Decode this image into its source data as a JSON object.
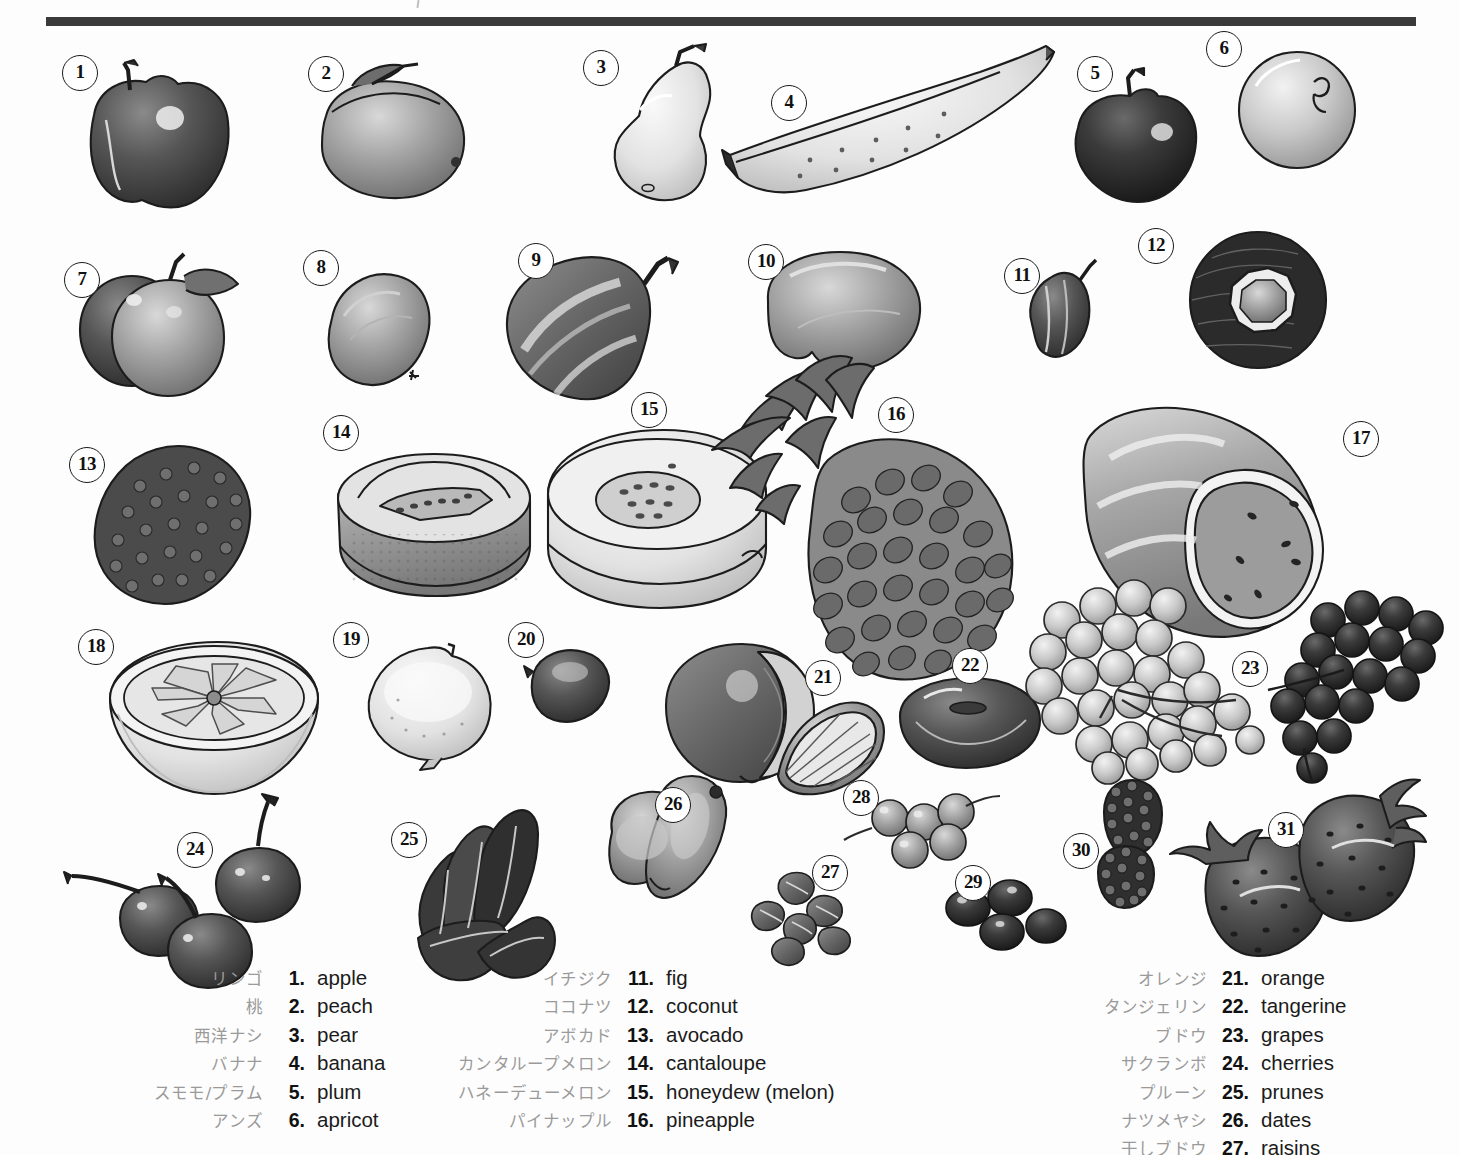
{
  "page": {
    "rule_color": "#3a3a3a",
    "background": "#ffffff",
    "text_color": "#1b1b1b",
    "japanese_text_color": "#9a9a9a"
  },
  "callouts": [
    {
      "n": "1",
      "x": 62,
      "y": 55,
      "item": "apple"
    },
    {
      "n": "2",
      "x": 308,
      "y": 56,
      "item": "peach"
    },
    {
      "n": "3",
      "x": 583,
      "y": 50,
      "item": "pear"
    },
    {
      "n": "4",
      "x": 771,
      "y": 85,
      "item": "banana"
    },
    {
      "n": "5",
      "x": 1077,
      "y": 56,
      "item": "plum"
    },
    {
      "n": "6",
      "x": 1206,
      "y": 31,
      "item": "apricot"
    },
    {
      "n": "7",
      "x": 64,
      "y": 262,
      "item": "apricots"
    },
    {
      "n": "8",
      "x": 303,
      "y": 250,
      "item": "kiwi"
    },
    {
      "n": "9",
      "x": 518,
      "y": 243,
      "item": "papaya"
    },
    {
      "n": "10",
      "x": 748,
      "y": 244,
      "item": "mango"
    },
    {
      "n": "11",
      "x": 1004,
      "y": 258,
      "item": "fig"
    },
    {
      "n": "12",
      "x": 1138,
      "y": 228,
      "item": "coconut"
    },
    {
      "n": "13",
      "x": 69,
      "y": 447,
      "item": "avocado"
    },
    {
      "n": "14",
      "x": 323,
      "y": 415,
      "item": "cantaloupe"
    },
    {
      "n": "15",
      "x": 631,
      "y": 392,
      "item": "honeydew"
    },
    {
      "n": "16",
      "x": 878,
      "y": 397,
      "item": "pineapple"
    },
    {
      "n": "17",
      "x": 1343,
      "y": 421,
      "item": "watermelon"
    },
    {
      "n": "18",
      "x": 78,
      "y": 629,
      "item": "grapefruit"
    },
    {
      "n": "19",
      "x": 333,
      "y": 622,
      "item": "lemon"
    },
    {
      "n": "20",
      "x": 508,
      "y": 622,
      "item": "lime"
    },
    {
      "n": "21",
      "x": 805,
      "y": 660,
      "item": "orange"
    },
    {
      "n": "22",
      "x": 952,
      "y": 648,
      "item": "tangerine"
    },
    {
      "n": "23",
      "x": 1232,
      "y": 651,
      "item": "grapes"
    },
    {
      "n": "24",
      "x": 177,
      "y": 832,
      "item": "cherries"
    },
    {
      "n": "25",
      "x": 391,
      "y": 822,
      "item": "prunes"
    },
    {
      "n": "26",
      "x": 655,
      "y": 787,
      "item": "dates"
    },
    {
      "n": "27",
      "x": 812,
      "y": 855,
      "item": "raisins"
    },
    {
      "n": "28",
      "x": 843,
      "y": 780,
      "item": "currants"
    },
    {
      "n": "29",
      "x": 955,
      "y": 865,
      "item": "olives"
    },
    {
      "n": "30",
      "x": 1063,
      "y": 833,
      "item": "blackberries"
    },
    {
      "n": "31",
      "x": 1268,
      "y": 812,
      "item": "strawberries"
    }
  ],
  "legend": {
    "columns": [
      {
        "id": "col-1",
        "entries": [
          {
            "jp": "リンゴ",
            "num": "1.",
            "en": "apple"
          },
          {
            "jp": "桃",
            "num": "2.",
            "en": "peach"
          },
          {
            "jp": "西洋ナシ",
            "num": "3.",
            "en": "pear"
          },
          {
            "jp": "バナナ",
            "num": "4.",
            "en": "banana"
          },
          {
            "jp": "スモモ/プラム",
            "num": "5.",
            "en": "plum"
          },
          {
            "jp": "アンズ",
            "num": "6.",
            "en": "apricot"
          }
        ]
      },
      {
        "id": "col-2",
        "entries": [
          {
            "jp": "イチジク",
            "num": "11.",
            "en": "fig"
          },
          {
            "jp": "ココナツ",
            "num": "12.",
            "en": "coconut"
          },
          {
            "jp": "アボカド",
            "num": "13.",
            "en": "avocado"
          },
          {
            "jp": "カンタループメロン",
            "num": "14.",
            "en": "cantaloupe"
          },
          {
            "jp": "ハネーデューメロン",
            "num": "15.",
            "en": "honeydew (melon)"
          },
          {
            "jp": "パイナップル",
            "num": "16.",
            "en": "pineapple"
          }
        ]
      },
      {
        "id": "col-3",
        "entries": [
          {
            "jp": "オレンジ",
            "num": "21.",
            "en": "orange"
          },
          {
            "jp": "タンジェリン",
            "num": "22.",
            "en": "tangerine"
          },
          {
            "jp": "ブドウ",
            "num": "23.",
            "en": "grapes"
          },
          {
            "jp": "サクランボ",
            "num": "24.",
            "en": "cherries"
          },
          {
            "jp": "プルーン",
            "num": "25.",
            "en": "prunes"
          },
          {
            "jp": "ナツメヤシ",
            "num": "26.",
            "en": "dates"
          },
          {
            "jp": "干しブドウ",
            "num": "27.",
            "en": "raisins"
          }
        ]
      }
    ]
  }
}
